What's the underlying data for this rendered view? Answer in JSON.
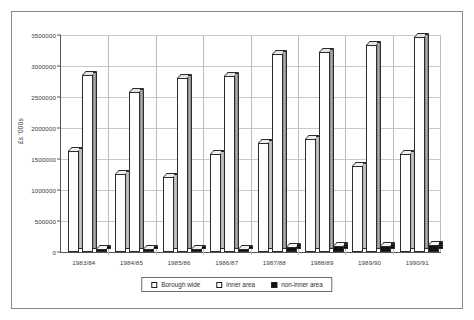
{
  "chart_data": {
    "type": "bar",
    "title": "",
    "subtitle": "",
    "xlabel": "",
    "ylabel": "£s '000s",
    "categories": [
      "1983/84",
      "1984/85",
      "1985/86",
      "1986/87",
      "1987/88",
      "1988/89",
      "1989/90",
      "1990/91"
    ],
    "series": [
      {
        "name": "Borough wide",
        "color": "#fdfdfd",
        "values": [
          1620000,
          1250000,
          1210000,
          1570000,
          1750000,
          1820000,
          1380000,
          1570000
        ]
      },
      {
        "name": "inner area",
        "color": "#ffffff",
        "values": [
          2840000,
          2570000,
          2800000,
          2820000,
          3180000,
          3210000,
          3320000,
          3450000
        ]
      },
      {
        "name": "non-inner area",
        "color": "#101010",
        "values": [
          55000,
          45000,
          50000,
          50000,
          80000,
          90000,
          100000,
          110000
        ]
      }
    ],
    "ylim": [
      0,
      3500000
    ],
    "ytick_step": 500000,
    "yticks": [
      0,
      500000,
      1000000,
      1500000,
      2000000,
      2500000,
      3000000,
      3500000
    ],
    "ytick_labels": [
      "0",
      "500000",
      "1000000",
      "1500000",
      "2000000",
      "2500000",
      "3000000",
      "3500000"
    ],
    "grid": true,
    "legend_position": "bottom",
    "style": "3d-column"
  },
  "legend": {
    "items": [
      {
        "label": "Borough wide",
        "swatch": "white"
      },
      {
        "label": "inner area",
        "swatch": "white"
      },
      {
        "label": "non-inner area",
        "swatch": "black"
      }
    ]
  }
}
